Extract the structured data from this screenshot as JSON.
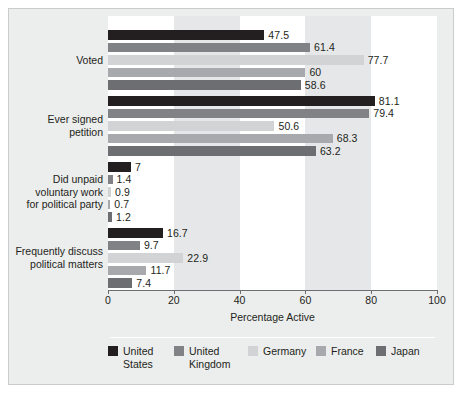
{
  "chart_data": {
    "type": "bar",
    "orientation": "horizontal",
    "title": "",
    "xlabel": "Percentage Active",
    "ylabel": "",
    "xlim": [
      0,
      100
    ],
    "xticks": [
      "0",
      "20",
      "40",
      "60",
      "80",
      "100"
    ],
    "grid": false,
    "bands": "alternating vertical shading every 20 units",
    "legend_position": "bottom",
    "categories": [
      "Voted",
      "Ever signed\npetition",
      "Did unpaid\nvoluntary work\nfor political party",
      "Frequently discuss\npolitical matters"
    ],
    "series": [
      {
        "name": "United\nStates",
        "legend_label": "United\nStates",
        "color": "#231f20",
        "values": [
          47.5,
          81.1,
          7,
          16.7
        ],
        "labels": [
          "47.5",
          "81.1",
          "7",
          "16.7"
        ]
      },
      {
        "name": "United\nKingdom",
        "legend_label": "United\nKingdom",
        "color": "#808285",
        "values": [
          61.4,
          79.4,
          1.4,
          9.7
        ],
        "labels": [
          "61.4",
          "79.4",
          "1.4",
          "9.7"
        ]
      },
      {
        "name": "Germany",
        "legend_label": "Germany",
        "color": "#d1d3d4",
        "values": [
          77.7,
          50.6,
          0.9,
          22.9
        ],
        "labels": [
          "77.7",
          "50.6",
          "0.9",
          "22.9"
        ]
      },
      {
        "name": "France",
        "legend_label": "France",
        "color": "#a7a9ac",
        "values": [
          60,
          68.3,
          0.7,
          11.7
        ],
        "labels": [
          "60",
          "68.3",
          "0.7",
          "11.7"
        ]
      },
      {
        "name": "Japan",
        "legend_label": "Japan",
        "color": "#6d6e71",
        "values": [
          58.6,
          63.2,
          1.2,
          7.4
        ],
        "labels": [
          "58.6",
          "63.2",
          "1.2",
          "7.4"
        ]
      }
    ]
  },
  "axis": {
    "x_title": "Percentage Active",
    "ticks": [
      {
        "value": 0,
        "label": "0"
      },
      {
        "value": 20,
        "label": "20"
      },
      {
        "value": 40,
        "label": "40"
      },
      {
        "value": 60,
        "label": "60"
      },
      {
        "value": 80,
        "label": "80"
      },
      {
        "value": 100,
        "label": "100"
      }
    ]
  },
  "legend": {
    "items": [
      {
        "label": "United\nStates",
        "color": "#231f20"
      },
      {
        "label": "United\nKingdom",
        "color": "#808285"
      },
      {
        "label": "Germany",
        "color": "#d1d3d4"
      },
      {
        "label": "France",
        "color": "#a7a9ac"
      },
      {
        "label": "Japan",
        "color": "#6d6e71"
      }
    ]
  }
}
